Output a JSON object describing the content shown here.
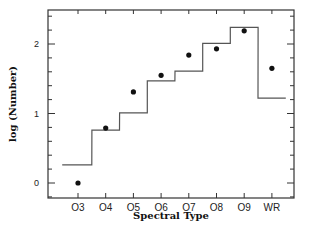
{
  "chart_data": {
    "type": "line",
    "title": "",
    "xlabel": "Spectral Type",
    "ylabel": "log (Number)",
    "categories": [
      "O3",
      "O4",
      "O5",
      "O6",
      "O7",
      "O8",
      "O9",
      "WR"
    ],
    "series": [
      {
        "name": "histogram (step)",
        "style": "step",
        "values": [
          0.26,
          0.76,
          1.01,
          1.47,
          1.61,
          2.01,
          2.24,
          1.22
        ]
      },
      {
        "name": "observed (points)",
        "style": "scatter",
        "values": [
          0.0,
          0.79,
          1.31,
          1.55,
          1.84,
          1.93,
          2.19,
          1.65
        ]
      }
    ],
    "yticks": [
      0,
      1,
      2
    ],
    "ytick_labels": [
      "0",
      "1",
      "2"
    ],
    "ylim": [
      -0.2,
      2.5
    ],
    "grid": false,
    "legend": null
  },
  "plot": {
    "left": 48,
    "right": 294,
    "top": 10,
    "bottom": 198,
    "y0_px": 183,
    "px_per_unit": 69.5,
    "x_first_px": 78,
    "x_spacing_px": 27.7,
    "line_color": "#555555",
    "dot_color": "#111111",
    "axis_color": "#333333"
  }
}
